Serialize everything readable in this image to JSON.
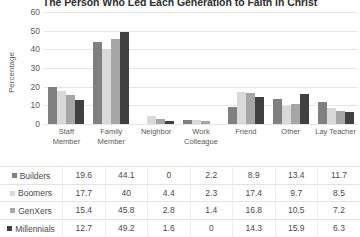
{
  "chart_data": {
    "type": "bar",
    "title": "The Person Who Led Each Generation to Faith in Christ",
    "xlabel": "",
    "ylabel": "Percentage",
    "ylim": [
      0,
      60
    ],
    "yticks": [
      60,
      50,
      40,
      30,
      20,
      10,
      0
    ],
    "grid": true,
    "legend_position": "bottom-table",
    "categories": [
      "Staff Member",
      "Family Member",
      "Neighbor",
      "Work Colleague",
      "Friend",
      "Other",
      "Lay Teacher"
    ],
    "series": [
      {
        "name": "Builders",
        "color": "#808080",
        "values": [
          19.6,
          44.1,
          0,
          2.2,
          8.9,
          13.4,
          11.7
        ]
      },
      {
        "name": "Boomers",
        "color": "#d9d9d9",
        "values": [
          17.7,
          40,
          4.4,
          2.3,
          17.4,
          9.7,
          8.5
        ]
      },
      {
        "name": "GenXers",
        "color": "#a6a6a6",
        "values": [
          15.4,
          45.8,
          2.8,
          1.4,
          16.8,
          10.5,
          7.2
        ]
      },
      {
        "name": "Millennials",
        "color": "#404040",
        "values": [
          12.7,
          49.2,
          1.6,
          0,
          14.3,
          15.9,
          6.3
        ]
      }
    ]
  }
}
